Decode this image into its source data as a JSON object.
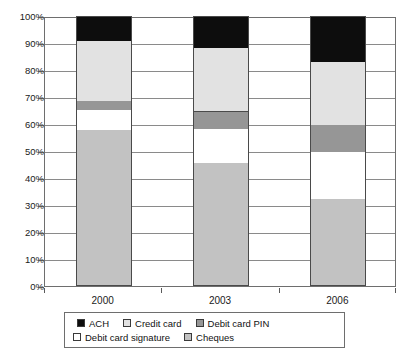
{
  "chart_data": {
    "type": "bar",
    "subtype": "stacked-percent-column",
    "title": "",
    "subtitle": "",
    "xlabel": "",
    "ylabel": "",
    "categories": [
      "2000",
      "2003",
      "2006"
    ],
    "ylim": [
      0,
      100
    ],
    "ytick_values": [
      0,
      10,
      20,
      30,
      40,
      50,
      60,
      70,
      80,
      90,
      100
    ],
    "ytick_labels": [
      "0%",
      "10%",
      "20%",
      "30%",
      "40%",
      "50%",
      "60%",
      "70%",
      "80%",
      "90%",
      "100%"
    ],
    "grid": true,
    "grid_axis": "y",
    "legend_position": "bottom",
    "stack_order_bottom_to_top": [
      "Cheques",
      "Debit card signature",
      "Debit card PIN",
      "Credit card",
      "ACH"
    ],
    "series": [
      {
        "name": "ACH",
        "color": "#0d0d0d",
        "values": [
          9.0,
          11.5,
          16.5
        ]
      },
      {
        "name": "Credit card",
        "color": "#e2e2e2",
        "values": [
          22.0,
          23.5,
          23.5
        ]
      },
      {
        "name": "Debit card PIN",
        "color": "#969696",
        "values": [
          3.5,
          6.5,
          10.0
        ]
      },
      {
        "name": "Debit card signature",
        "color": "#ffffff",
        "values": [
          7.5,
          12.5,
          17.5
        ]
      },
      {
        "name": "Cheques",
        "color": "#c2c2c2",
        "values": [
          58.0,
          46.0,
          32.5
        ]
      }
    ],
    "cumulative_tops": {
      "2000": {
        "Cheques": 58.0,
        "Debit card signature": 65.5,
        "Debit card PIN": 69.0,
        "Credit card": 91.0,
        "ACH": 100.0
      },
      "2003": {
        "Cheques": 46.0,
        "Debit card signature": 58.5,
        "Debit card PIN": 65.0,
        "Credit card": 88.5,
        "ACH": 100.0
      },
      "2006": {
        "Cheques": 32.5,
        "Debit card signature": 50.0,
        "Debit card PIN": 60.0,
        "Credit card": 83.5,
        "ACH": 100.0
      }
    }
  },
  "legend": {
    "row1": [
      {
        "label": "ACH",
        "swatch": "sw-ach"
      },
      {
        "label": "Credit card",
        "swatch": "sw-credit"
      },
      {
        "label": "Debit card PIN",
        "swatch": "sw-pin"
      }
    ],
    "row2": [
      {
        "label": "Debit card signature",
        "swatch": "sw-signature"
      },
      {
        "label": "Cheques",
        "swatch": "sw-cheques"
      }
    ]
  }
}
